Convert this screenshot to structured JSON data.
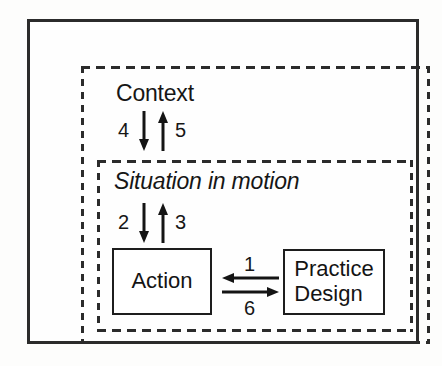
{
  "diagram": {
    "outer_frame": {
      "name": "outer-frame",
      "style": "solid"
    },
    "containers": [
      {
        "id": "context",
        "label": "Context",
        "style": "dashed",
        "italic": false
      },
      {
        "id": "situation",
        "label": "Situation in motion",
        "style": "dashed",
        "italic": true
      }
    ],
    "nodes": [
      {
        "id": "action",
        "label": "Action",
        "style": "solid"
      },
      {
        "id": "practice_design",
        "label": "Practice\nDesign",
        "line1": "Practice",
        "line2": "Design",
        "style": "solid"
      }
    ],
    "arrows": [
      {
        "id": "a1",
        "label": "1",
        "direction": "left",
        "from": "practice_design",
        "to": "action"
      },
      {
        "id": "a2",
        "label": "2",
        "direction": "down",
        "from": "situation",
        "to": "action"
      },
      {
        "id": "a3",
        "label": "3",
        "direction": "up",
        "from": "action",
        "to": "situation"
      },
      {
        "id": "a4",
        "label": "4",
        "direction": "down",
        "from": "context",
        "to": "situation"
      },
      {
        "id": "a5",
        "label": "5",
        "direction": "up",
        "from": "situation",
        "to": "context"
      },
      {
        "id": "a6",
        "label": "6",
        "direction": "right",
        "from": "action",
        "to": "practice_design"
      }
    ],
    "colors": {
      "ink": "#1d1d1d",
      "background": "#fdfdfc"
    }
  }
}
